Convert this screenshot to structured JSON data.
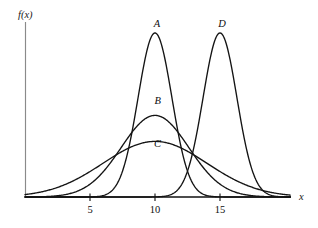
{
  "chart_data": {
    "type": "line",
    "title": "",
    "xlabel": "x",
    "ylabel": "f(x)",
    "xlim": [
      0,
      20.4
    ],
    "ylim": [
      0,
      1.0
    ],
    "grid": false,
    "legend": "inline-labels",
    "x_ticks": [
      {
        "value": 5,
        "label": "5"
      },
      {
        "value": 10,
        "label": "10"
      },
      {
        "value": 15,
        "label": "15"
      }
    ],
    "y_ticks": [],
    "series": [
      {
        "name": "A",
        "label": "A",
        "shape": "normal-density",
        "mean": 10,
        "sigma": 1.3,
        "peak_height": 0.965,
        "label_x": 10.15,
        "label_y": 1.0,
        "color": "#141414"
      },
      {
        "name": "B",
        "label": "B",
        "shape": "normal-density",
        "mean": 10,
        "sigma": 2.6,
        "peak_height": 0.48,
        "label_x": 10.2,
        "label_y": 0.545,
        "color": "#141414"
      },
      {
        "name": "C",
        "label": "C",
        "shape": "normal-density",
        "mean": 10,
        "sigma": 4.0,
        "peak_height": 0.327,
        "label_x": 10.2,
        "label_y": 0.295,
        "color": "#141414"
      },
      {
        "name": "D",
        "label": "D",
        "shape": "normal-density",
        "mean": 15,
        "sigma": 1.3,
        "peak_height": 0.965,
        "label_x": 15.15,
        "label_y": 1.0,
        "color": "#141414"
      }
    ],
    "annotations": [
      {
        "text": "A",
        "x": 10.15,
        "y": 1.0
      },
      {
        "text": "B",
        "x": 10.2,
        "y": 0.545
      },
      {
        "text": "C",
        "x": 10.2,
        "y": 0.295
      },
      {
        "text": "D",
        "x": 15.15,
        "y": 1.0
      }
    ]
  },
  "axes": {
    "x_axis_name": "x",
    "y_axis_name": "f(x)"
  }
}
